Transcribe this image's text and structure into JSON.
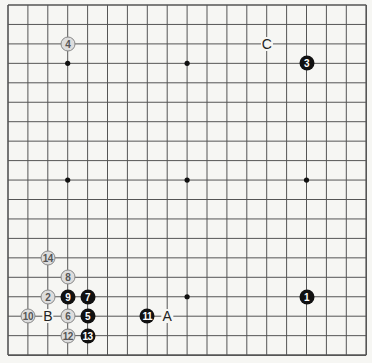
{
  "board": {
    "size": 19,
    "origin_x": 8,
    "origin_y": 5,
    "spacing_x": 19.9,
    "spacing_y": 19.45,
    "line_color": "#555555",
    "hoshi": [
      [
        3,
        3
      ],
      [
        9,
        3
      ],
      [
        15,
        3
      ],
      [
        3,
        9
      ],
      [
        9,
        9
      ],
      [
        15,
        9
      ],
      [
        3,
        15
      ],
      [
        9,
        15
      ],
      [
        15,
        15
      ]
    ]
  },
  "stones": [
    {
      "move": "1",
      "color": "black",
      "col": 15,
      "row": 15
    },
    {
      "move": "2",
      "color": "white",
      "col": 2,
      "row": 15
    },
    {
      "move": "3",
      "color": "black",
      "col": 15,
      "row": 3
    },
    {
      "move": "4",
      "color": "white",
      "col": 3,
      "row": 2
    },
    {
      "move": "5",
      "color": "black",
      "col": 4,
      "row": 16
    },
    {
      "move": "6",
      "color": "white",
      "col": 3,
      "row": 16
    },
    {
      "move": "7",
      "color": "black",
      "col": 4,
      "row": 15
    },
    {
      "move": "8",
      "color": "white",
      "col": 3,
      "row": 14
    },
    {
      "move": "9",
      "color": "black",
      "col": 3,
      "row": 15
    },
    {
      "move": "10",
      "color": "white",
      "col": 1,
      "row": 16
    },
    {
      "move": "11",
      "color": "black",
      "col": 7,
      "row": 16
    },
    {
      "move": "12",
      "color": "white",
      "col": 3,
      "row": 17
    },
    {
      "move": "13",
      "color": "black",
      "col": 4,
      "row": 17
    },
    {
      "move": "14",
      "color": "white",
      "col": 2,
      "row": 13
    }
  ],
  "marks": [
    {
      "label": "A",
      "col": 8,
      "row": 16
    },
    {
      "label": "B",
      "col": 2,
      "row": 16
    },
    {
      "label": "C",
      "col": 13,
      "row": 2
    }
  ]
}
